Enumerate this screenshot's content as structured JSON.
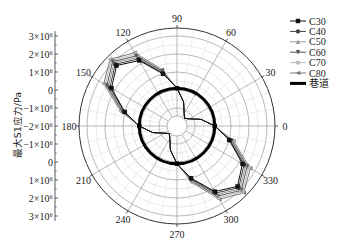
{
  "chart_data": {
    "type": "polar-line",
    "title": "",
    "ylabel": "最大S1应力/Pa",
    "radial_axis": {
      "ticks": [
        "3×10⁶",
        "2×10⁶",
        "1×10⁶",
        "0",
        "−1×10⁶",
        "−2×10⁶",
        "−1×10⁶",
        "0",
        "1×10⁶",
        "2×10⁶",
        "3×10⁶"
      ],
      "range": [
        -2000000,
        3000000
      ]
    },
    "angular_axis": {
      "ticks": [
        "0",
        "30",
        "60",
        "90",
        "120",
        "150",
        "180",
        "210",
        "240",
        "270",
        "300",
        "330"
      ]
    },
    "grid": true,
    "legend_position": "right",
    "angles": [
      0,
      15,
      30,
      45,
      60,
      75,
      90,
      105,
      120,
      135,
      150,
      165,
      180,
      195,
      210,
      225,
      240,
      255,
      270,
      285,
      300,
      315,
      330,
      345
    ],
    "series": [
      {
        "name": "C30",
        "marker": "square",
        "color": "#111111",
        "values": [
          0.1,
          -0.6,
          -1.2,
          -1.4,
          -1.2,
          -0.6,
          0.1,
          1.0,
          2.2,
          2.75,
          2.2,
          1.0,
          0.1,
          -0.6,
          -1.2,
          -1.4,
          -1.2,
          -0.6,
          0.1,
          1.0,
          2.2,
          2.75,
          2.2,
          1.0
        ]
      },
      {
        "name": "C40",
        "marker": "circle",
        "color": "#444444",
        "values": [
          0.1,
          -0.6,
          -1.2,
          -1.4,
          -1.2,
          -0.6,
          0.1,
          1.05,
          2.3,
          2.85,
          2.3,
          1.05,
          0.1,
          -0.6,
          -1.2,
          -1.4,
          -1.2,
          -0.6,
          0.1,
          1.05,
          2.3,
          2.85,
          2.3,
          1.05
        ]
      },
      {
        "name": "C50",
        "marker": "triangle-up",
        "color": "#999999",
        "values": [
          0.1,
          -0.6,
          -1.2,
          -1.4,
          -1.2,
          -0.6,
          0.1,
          1.1,
          2.4,
          2.95,
          2.4,
          1.1,
          0.1,
          -0.6,
          -1.2,
          -1.4,
          -1.2,
          -0.6,
          0.1,
          1.1,
          2.4,
          2.95,
          2.4,
          1.1
        ]
      },
      {
        "name": "C60",
        "marker": "triangle-down",
        "color": "#555555",
        "values": [
          0.1,
          -0.6,
          -1.2,
          -1.4,
          -1.2,
          -0.6,
          0.1,
          1.15,
          2.5,
          3.05,
          2.5,
          1.15,
          0.1,
          -0.6,
          -1.2,
          -1.4,
          -1.2,
          -0.6,
          0.1,
          1.15,
          2.5,
          3.05,
          2.5,
          1.15
        ]
      },
      {
        "name": "C70",
        "marker": "circle",
        "color": "#bbbbbb",
        "values": [
          0.1,
          -0.6,
          -1.2,
          -1.4,
          -1.2,
          -0.6,
          0.1,
          1.2,
          2.6,
          3.15,
          2.6,
          1.2,
          0.1,
          -0.6,
          -1.2,
          -1.4,
          -1.2,
          -0.6,
          0.1,
          1.2,
          2.6,
          3.15,
          2.6,
          1.2
        ]
      },
      {
        "name": "C80",
        "marker": "triangle-left",
        "color": "#777777",
        "values": [
          0.1,
          -0.6,
          -1.2,
          -1.4,
          -1.2,
          -0.6,
          0.1,
          1.25,
          2.7,
          3.25,
          2.7,
          1.25,
          0.1,
          -0.6,
          -1.2,
          -1.4,
          -1.2,
          -0.6,
          0.1,
          1.25,
          2.7,
          3.25,
          2.7,
          1.25
        ]
      },
      {
        "name": "巷道",
        "marker": "none",
        "color": "#000000",
        "line_width": 3,
        "constant_value": 0.1
      }
    ],
    "value_unit": "×10⁶ Pa"
  },
  "legend": {
    "items": [
      {
        "label": "C30"
      },
      {
        "label": "C40"
      },
      {
        "label": "C50"
      },
      {
        "label": "C60"
      },
      {
        "label": "C70"
      },
      {
        "label": "C80"
      },
      {
        "label": "巷道"
      }
    ]
  }
}
